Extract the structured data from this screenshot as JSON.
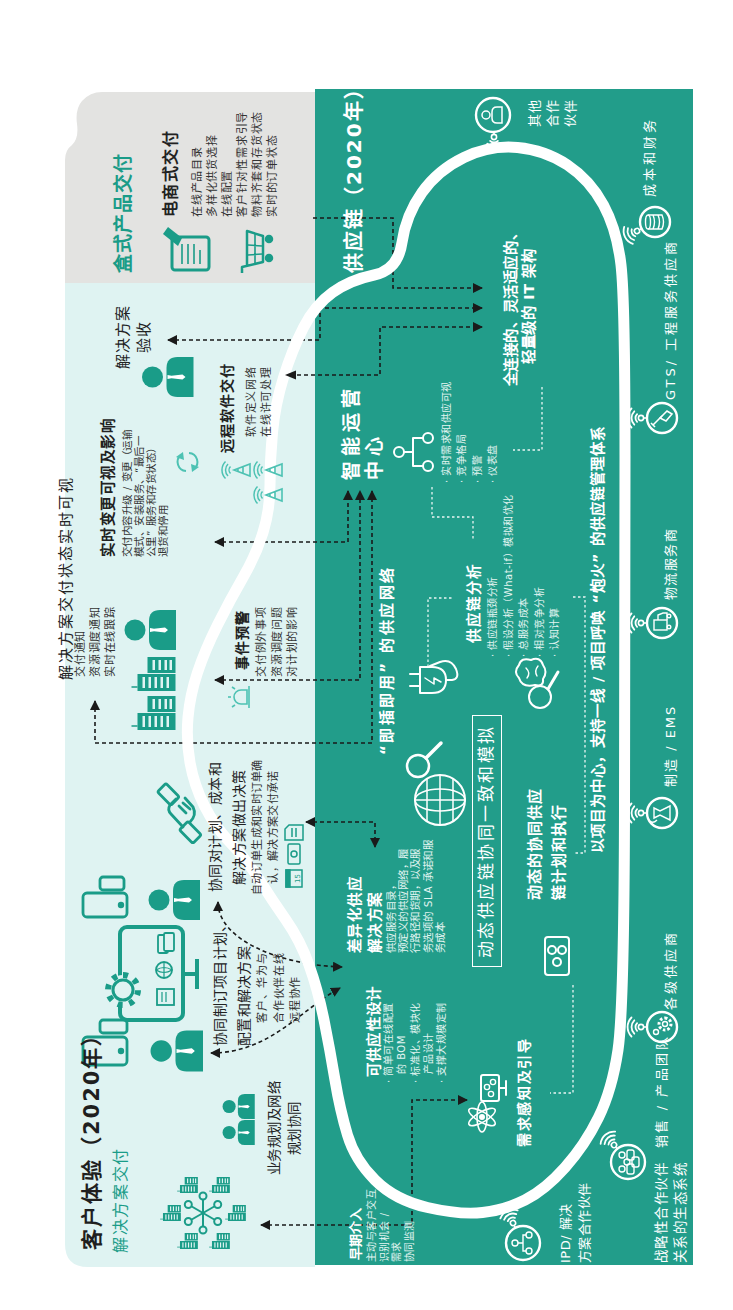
{
  "colors": {
    "light_panel": "#dff3f2",
    "gray_panel": "#e3e3e1",
    "dark_panel": "#229d8a",
    "accent_teal": "#1a9c88",
    "light_icon_teal": "#4dc2b3",
    "connector": "#1a1a1a",
    "loop": "#ffffff"
  },
  "customer_experience": {
    "title": "客户体验（2020年）",
    "subtitle": "解决方案交付",
    "visibility_headline": "解决方案交付状态实时可视",
    "business_planning": [
      "业务规划及网络",
      "规划协同"
    ],
    "co_planning": {
      "title": [
        "协同制订项目计划、",
        "配置和解决方案"
      ],
      "desc": [
        "客户、华为与",
        "合作伙伴在线",
        "远程协作"
      ]
    },
    "co_decision": {
      "title": [
        "协同对计划、成本和",
        "解决方案做出决策"
      ],
      "desc": [
        "自动订单生成和实时订单确",
        "认，解决方案交付承诺"
      ],
      "calendar_day": "15"
    },
    "delivery_notice": [
      "交付通知",
      "资源调度通知",
      "实时在线跟踪"
    ],
    "event_alert": {
      "title": "事件预警",
      "desc": [
        "交付例外事项",
        "资源调度问题",
        "对计划的影响"
      ]
    },
    "realtime_change": {
      "title": "实时变更可视及影响",
      "desc": [
        "交付内容升级 / 变更（运输",
        "模式、安装服务、“最后一",
        "公里” 服务和存货状态）",
        "退货和停用"
      ]
    },
    "remote_software": {
      "title": "远程软件交付",
      "desc": [
        "软件定义网络",
        "在线许可处理"
      ]
    },
    "acceptance": [
      "解决方案",
      "验收"
    ]
  },
  "box_delivery": {
    "title": "盒式产品交付",
    "ecommerce": {
      "title": "电商式交付",
      "items": [
        "在线产品目录",
        "多样化供货选择",
        "在线配置",
        "客户针对性需求引导",
        "物料齐套和存货状态",
        "实时的订单状态"
      ]
    }
  },
  "supply_chain": {
    "title": "供应链（2020年）",
    "it_architecture": [
      "全连接的、灵活适应的、",
      "轻量级的 IT 架构"
    ],
    "ops_center": {
      "title": [
        "智能运营",
        "中心"
      ],
      "items": [
        "· 实时需求和供应可视",
        "· 竞争格局",
        "· 预警",
        "· 仪表盘"
      ]
    },
    "plug_and_play": "“即插即用” 的供应网络",
    "analytics": {
      "title": "供应链分析",
      "items": [
        "· 供应链瓶颈分析",
        "· 假设分析（What-if）模拟和优化",
        "· 总服务成本",
        "· 相对竞争分析",
        "· 认知计算"
      ]
    },
    "dynamic_simulation": "动态供应链协同一致和模拟",
    "dynamic_planning": [
      "动态的协同供应",
      "链计划和执行"
    ],
    "differentiated_supply": {
      "title": [
        "差异化供应",
        "解决方案"
      ],
      "desc": [
        "供应服务目录，",
        "预定义的供应网络，履",
        "行路径和货期，以及服",
        "务选项的 SLA 承诺和服",
        "务成本"
      ]
    },
    "design_for_supply": {
      "title": "可供应性设计",
      "items": [
        "· 简单可在线配置",
        "的 BOM",
        "· 标准化、模块化",
        "产品设计",
        "· 支撑大规模定制"
      ]
    },
    "demand_sensing": "需求感知及引导",
    "early_engagement": {
      "title": "早期介入",
      "desc": [
        "主动与客户交互",
        "识别机会 /",
        "需求",
        "协同监测"
      ]
    },
    "project_centric": "以项目为中心，支持一线 / 项目呼唤 “炮火” 的供应链管理体系",
    "ecosystem_caption": [
      "战略性合作伙伴",
      "关系的生态系统"
    ],
    "partners": [
      {
        "label": [
          "IPD/ 解决",
          "方案合作伙伴"
        ],
        "icon": "people-network-icon"
      },
      {
        "label": [
          "销售 / 产品团队"
        ],
        "icon": "team-icon"
      },
      {
        "label": [
          "各级供应商"
        ],
        "icon": "gear-icon"
      },
      {
        "label": [
          "制造 / EMS"
        ],
        "icon": "factory-icon"
      },
      {
        "label": [
          "物流服务商"
        ],
        "icon": "truck-icon"
      },
      {
        "label": [
          "GTS/ 工程服务供应商"
        ],
        "icon": "shovel-icon"
      },
      {
        "label": [
          "成本和财务"
        ],
        "icon": "coins-icon"
      },
      {
        "label": [
          "其他",
          "合作",
          "伙伴"
        ],
        "icon": "person-icon"
      }
    ]
  }
}
